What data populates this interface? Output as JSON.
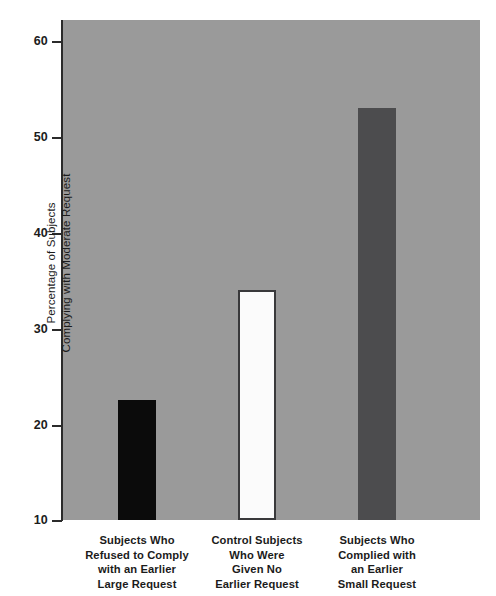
{
  "chart_data": {
    "type": "bar",
    "title": "",
    "subtitle": "",
    "xlabel": "",
    "ylabel": "Percentage of Subjects Complying with Moderate Request",
    "ylabel_lines": [
      "Percentage of Subjects",
      "Complying with Moderate Request"
    ],
    "ylim": [
      10,
      63
    ],
    "yticks": [
      10,
      20,
      30,
      40,
      50,
      60
    ],
    "ytick_labels": [
      "10",
      "20",
      "30",
      "40",
      "50",
      "60"
    ],
    "grid": false,
    "legend": "none",
    "plot_background": "#9a9a9a",
    "categories": [
      "Subjects Who Refused to Comply with an Earlier Large Request",
      "Control Subjects Who Were Given No Earlier Request",
      "Subjects Who Complied with an Earlier Small Request"
    ],
    "category_lines": [
      [
        "Subjects Who",
        "Refused to Comply",
        "with an Earlier",
        "Large Request"
      ],
      [
        "Control Subjects",
        "Who Were",
        "Given No",
        "Earlier Request"
      ],
      [
        "Subjects Who",
        "Complied with",
        "an Earlier",
        "Small Request"
      ]
    ],
    "values": [
      22.5,
      34,
      53
    ],
    "bar_colors": [
      "#0b0b0b",
      "#fbfbfb",
      "#4c4c4e"
    ],
    "bar_border_colors": [
      "#0b0b0b",
      "#39393b",
      "#4c4c4e"
    ]
  }
}
